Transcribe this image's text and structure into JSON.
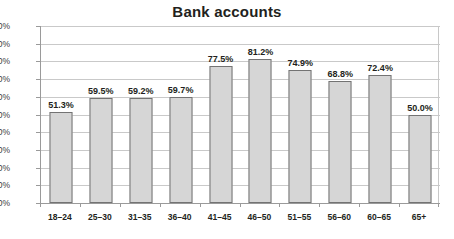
{
  "chart_data": {
    "type": "bar",
    "title": "Bank accounts",
    "xlabel": "",
    "ylabel": "",
    "categories": [
      "18–24",
      "25–30",
      "31–35",
      "36–40",
      "41–45",
      "46–50",
      "51–55",
      "56–60",
      "60–65",
      "65+"
    ],
    "values": [
      51.3,
      59.5,
      59.2,
      59.7,
      77.5,
      81.2,
      74.9,
      68.8,
      72.4,
      50.0
    ],
    "value_labels": [
      "51.3%",
      "59.5%",
      "59.2%",
      "59.7%",
      "77.5%",
      "81.2%",
      "74.9%",
      "68.8%",
      "72.4%",
      "50.0%"
    ],
    "ylim": [
      0,
      100
    ],
    "ytick_labels": [
      "100%",
      "90%",
      "80%",
      "70%",
      "60%",
      "50%",
      "40%",
      "30%",
      "20%",
      "10%",
      "0%"
    ],
    "ytick_values": [
      100,
      90,
      80,
      70,
      60,
      50,
      40,
      30,
      20,
      10,
      0
    ],
    "grid": true,
    "legend": false,
    "colors": {
      "bar_fill": "#d6d6d6",
      "bar_border": "#737373",
      "gridline": "#c9c9c9",
      "axis": "#9a9a9a",
      "text": "#231f20",
      "background": "#ffffff"
    }
  }
}
